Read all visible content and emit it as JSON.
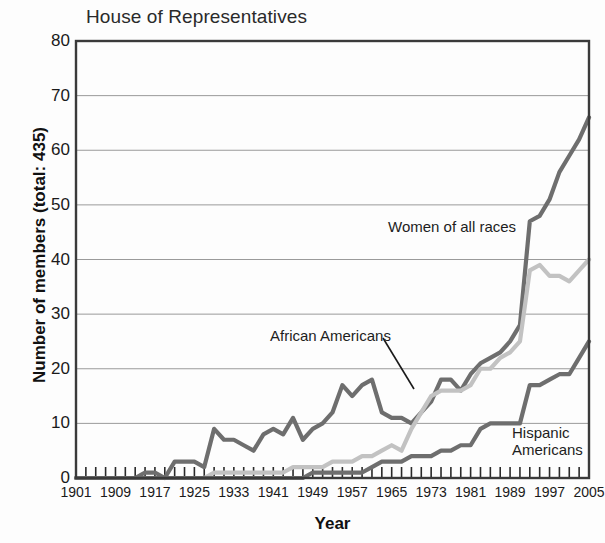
{
  "chart_data": {
    "type": "line",
    "title": "House of Representatives",
    "xlabel": "Year",
    "ylabel": "Number of members (total: 435)",
    "xlim": [
      1901,
      2005
    ],
    "ylim": [
      0,
      80
    ],
    "yticks": [
      0,
      10,
      20,
      30,
      40,
      50,
      60,
      70,
      80
    ],
    "xticks": [
      1901,
      1909,
      1917,
      1925,
      1933,
      1941,
      1949,
      1957,
      1965,
      1973,
      1981,
      1989,
      1997,
      2005
    ],
    "minor_xtick_interval": 2,
    "grid": "horizontal",
    "legend_position": "inline-annotations",
    "series": [
      {
        "name": "Women of all races",
        "color": "#6e6e6e",
        "x": [
          1901,
          1903,
          1905,
          1907,
          1909,
          1911,
          1913,
          1915,
          1917,
          1919,
          1921,
          1923,
          1925,
          1927,
          1929,
          1931,
          1933,
          1935,
          1937,
          1939,
          1941,
          1943,
          1945,
          1947,
          1949,
          1951,
          1953,
          1955,
          1957,
          1959,
          1961,
          1963,
          1965,
          1967,
          1969,
          1971,
          1973,
          1975,
          1977,
          1979,
          1981,
          1983,
          1985,
          1987,
          1989,
          1991,
          1993,
          1995,
          1997,
          1999,
          2001,
          2003,
          2005
        ],
        "values": [
          0,
          0,
          0,
          0,
          0,
          0,
          0,
          1,
          1,
          0,
          3,
          3,
          3,
          2,
          9,
          7,
          7,
          6,
          5,
          8,
          9,
          8,
          11,
          7,
          9,
          10,
          12,
          17,
          15,
          17,
          18,
          12,
          11,
          11,
          10,
          12,
          14,
          18,
          18,
          16,
          19,
          21,
          22,
          23,
          25,
          28,
          47,
          48,
          51,
          56,
          59,
          62,
          66
        ]
      },
      {
        "name": "African Americans",
        "color": "#c2c2c2",
        "x": [
          1901,
          1903,
          1905,
          1907,
          1909,
          1911,
          1913,
          1915,
          1917,
          1919,
          1921,
          1923,
          1925,
          1927,
          1929,
          1931,
          1933,
          1935,
          1937,
          1939,
          1941,
          1943,
          1945,
          1947,
          1949,
          1951,
          1953,
          1955,
          1957,
          1959,
          1961,
          1963,
          1965,
          1967,
          1969,
          1971,
          1973,
          1975,
          1977,
          1979,
          1981,
          1983,
          1985,
          1987,
          1989,
          1991,
          1993,
          1995,
          1997,
          1999,
          2001,
          2003,
          2005
        ],
        "values": [
          0,
          0,
          0,
          0,
          0,
          0,
          0,
          0,
          0,
          0,
          0,
          0,
          0,
          0,
          1,
          1,
          1,
          1,
          1,
          1,
          1,
          1,
          2,
          2,
          2,
          2,
          3,
          3,
          3,
          4,
          4,
          5,
          6,
          5,
          9,
          12,
          15,
          16,
          16,
          16,
          17,
          20,
          20,
          22,
          23,
          25,
          38,
          39,
          37,
          37,
          36,
          38,
          40
        ]
      },
      {
        "name": "Hispanic Americans",
        "color": "#6e6e6e",
        "x": [
          1901,
          1903,
          1905,
          1907,
          1909,
          1911,
          1913,
          1915,
          1917,
          1919,
          1921,
          1923,
          1925,
          1927,
          1929,
          1931,
          1933,
          1935,
          1937,
          1939,
          1941,
          1943,
          1945,
          1947,
          1949,
          1951,
          1953,
          1955,
          1957,
          1959,
          1961,
          1963,
          1965,
          1967,
          1969,
          1971,
          1973,
          1975,
          1977,
          1979,
          1981,
          1983,
          1985,
          1987,
          1989,
          1991,
          1993,
          1995,
          1997,
          1999,
          2001,
          2003,
          2005
        ],
        "values": [
          0,
          0,
          0,
          0,
          0,
          0,
          0,
          0,
          0,
          0,
          0,
          0,
          0,
          0,
          0,
          0,
          0,
          0,
          0,
          0,
          0,
          0,
          0,
          0,
          1,
          1,
          1,
          1,
          1,
          1,
          2,
          3,
          3,
          3,
          4,
          4,
          4,
          5,
          5,
          6,
          6,
          9,
          10,
          10,
          10,
          10,
          17,
          17,
          18,
          19,
          19,
          22,
          25
        ]
      }
    ],
    "annotations": [
      {
        "text": "Women of all races",
        "x": 388,
        "y": 218,
        "leader": false
      },
      {
        "text": "African Americans",
        "x": 270,
        "y": 327,
        "leader": true
      },
      {
        "text": "Hispanic Americans",
        "x": 512,
        "y": 424,
        "leader": false
      }
    ]
  },
  "axis": {
    "yticks": [
      "0",
      "10",
      "20",
      "30",
      "40",
      "50",
      "60",
      "70",
      "80"
    ],
    "xticks": [
      "1901",
      "1909",
      "1917",
      "1925",
      "1933",
      "1941",
      "1949",
      "1957",
      "1965",
      "1973",
      "1981",
      "1989",
      "1997",
      "2005"
    ]
  },
  "labels": {
    "title": "House of Representatives",
    "ylabel": "Number of members (total: 435)",
    "xlabel": "Year",
    "annot_women": "Women of all races",
    "annot_african": "African Americans",
    "annot_hispanic_line1": "Hispanic",
    "annot_hispanic_line2": "Americans"
  },
  "colors": {
    "women": "#6e6e6e",
    "african": "#c2c2c2",
    "hispanic": "#6e6e6e",
    "grid": "#9a9a9a",
    "frame": "#3a3a3a",
    "text": "#1a1a1a",
    "background": "#fdfdfd"
  }
}
